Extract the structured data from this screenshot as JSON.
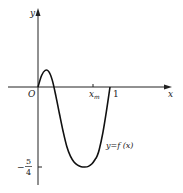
{
  "chart_data": {
    "type": "line",
    "title": "",
    "xlabel": "x",
    "ylabel": "y",
    "origin_label": "O",
    "x_tick_labels": [
      "x_m",
      "1"
    ],
    "x_tick_values": [
      0.82,
      1
    ],
    "y_tick_labels": [
      "-5/4"
    ],
    "y_tick_values": [
      -1.25
    ],
    "curve_label": "y=f(x)",
    "series": [
      {
        "name": "y=f(x)",
        "x": [
          0,
          0.05,
          0.1,
          0.15,
          0.2,
          0.25,
          0.3,
          0.35,
          0.4,
          0.45,
          0.5,
          0.55,
          0.6,
          0.65,
          0.7,
          0.75,
          0.8,
          0.82,
          0.85,
          0.9,
          0.95,
          1.0
        ],
        "y": [
          0,
          0.18,
          0.26,
          0.24,
          0.1,
          -0.15,
          -0.43,
          -0.7,
          -0.93,
          -1.08,
          -1.17,
          -1.22,
          -1.245,
          -1.25,
          -1.24,
          -1.2,
          -1.12,
          -1.08,
          -0.98,
          -0.72,
          -0.38,
          0
        ]
      }
    ],
    "xlim": [
      -0.2,
      1.2
    ],
    "ylim": [
      -1.45,
      1.3
    ],
    "grid": false,
    "legend": "none"
  },
  "labels": {
    "x_axis": "x",
    "y_axis": "y",
    "origin": "O",
    "xm_main": "x",
    "xm_sub": "m",
    "one": "1",
    "neg_sign": "−",
    "frac_num": "5",
    "frac_den": "4",
    "curve": "y=f (x)"
  }
}
